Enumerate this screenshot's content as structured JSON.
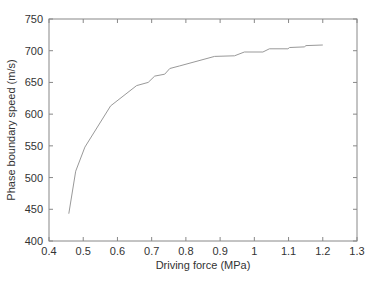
{
  "chart_data": {
    "type": "line",
    "title": "",
    "xlabel": "Driving force (MPa)",
    "ylabel": "Phase boundary speed (m/s)",
    "xlim": [
      0.4,
      1.3
    ],
    "ylim": [
      400,
      750
    ],
    "xticks": [
      0.4,
      0.5,
      0.6,
      0.7,
      0.8,
      0.9,
      1,
      1.1,
      1.2,
      1.3
    ],
    "xtick_labels": [
      "0.4",
      "0.5",
      "0.6",
      "0.7",
      "0.8",
      "0.9",
      "1",
      "1.1",
      "1.2",
      "1.3"
    ],
    "yticks": [
      400,
      450,
      500,
      550,
      600,
      650,
      700,
      750
    ],
    "ytick_labels": [
      "400",
      "450",
      "500",
      "550",
      "600",
      "650",
      "700",
      "750"
    ],
    "grid": false,
    "legend": null,
    "series": [
      {
        "name": "Phase boundary speed",
        "color": "#999999",
        "x": [
          0.458,
          0.478,
          0.505,
          0.58,
          0.656,
          0.69,
          0.709,
          0.738,
          0.753,
          0.782,
          0.884,
          0.942,
          0.971,
          1.025,
          1.044,
          1.098,
          1.103,
          1.146,
          1.151,
          1.2
        ],
        "y": [
          443,
          510,
          548,
          613,
          645,
          650,
          660,
          663,
          672,
          676,
          691,
          692,
          698,
          698,
          703,
          703,
          705,
          706,
          708,
          709
        ]
      }
    ]
  },
  "colors": {
    "frame": "#888888",
    "text": "#333333",
    "line": "#999999"
  }
}
